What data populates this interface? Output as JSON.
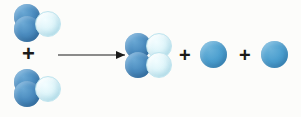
{
  "diagram": {
    "type": "chemical-reaction-equation",
    "background_color": "#fcfcfa",
    "canvas": {
      "width": 301,
      "height": 117
    },
    "atom_colors": {
      "dark_blue": "#4c8dc0",
      "light_blue": "#dff5fa",
      "medium_blue": "#4c9fcf"
    },
    "operators": {
      "plus_symbol": "+",
      "arrow_symbol": "→",
      "plus_color": "#1a1a1a",
      "arrow_color": "#1a1a1a"
    },
    "reactants": [
      {
        "id": "reactant-molecule-1",
        "label": "reactant molecule 1",
        "atoms": [
          {
            "id": "r1-atom-1",
            "color_key": "dark_blue",
            "x": 14,
            "y": 4,
            "d": 26
          },
          {
            "id": "r1-atom-2",
            "color_key": "dark_blue",
            "x": 14,
            "y": 16,
            "d": 26
          },
          {
            "id": "r1-atom-3",
            "color_key": "light_blue",
            "x": 35,
            "y": 11,
            "d": 26
          }
        ]
      },
      {
        "id": "reactant-molecule-2",
        "label": "reactant molecule 2",
        "atoms": [
          {
            "id": "r2-atom-1",
            "color_key": "dark_blue",
            "x": 14,
            "y": 69,
            "d": 26
          },
          {
            "id": "r2-atom-2",
            "color_key": "dark_blue",
            "x": 14,
            "y": 81,
            "d": 26
          },
          {
            "id": "r2-atom-3",
            "color_key": "light_blue",
            "x": 35,
            "y": 76,
            "d": 26
          }
        ]
      }
    ],
    "products": [
      {
        "id": "product-molecule-1",
        "label": "product molecule",
        "atoms": [
          {
            "id": "p1-atom-1",
            "color_key": "dark_blue",
            "x": 125,
            "y": 33,
            "d": 26
          },
          {
            "id": "p1-atom-2",
            "color_key": "dark_blue",
            "x": 125,
            "y": 52,
            "d": 26
          },
          {
            "id": "p1-atom-3",
            "color_key": "light_blue",
            "x": 146,
            "y": 33,
            "d": 26
          },
          {
            "id": "p1-atom-4",
            "color_key": "light_blue",
            "x": 146,
            "y": 52,
            "d": 26
          }
        ]
      },
      {
        "id": "product-atom-single-1",
        "label": "single product atom 1",
        "atoms": [
          {
            "id": "p2-atom-1",
            "color_key": "medium_blue",
            "x": 200,
            "y": 41,
            "d": 27
          }
        ]
      },
      {
        "id": "product-atom-single-2",
        "label": "single product atom 2",
        "atoms": [
          {
            "id": "p3-atom-1",
            "color_key": "medium_blue",
            "x": 261,
            "y": 41,
            "d": 27
          }
        ]
      }
    ],
    "plus_signs": [
      {
        "id": "plus-reactants",
        "text": "+",
        "x": 22,
        "y": 44,
        "size": 22
      },
      {
        "id": "plus-products-first",
        "text": "+",
        "x": 178,
        "y": 44,
        "size": 20
      },
      {
        "id": "plus-products-second",
        "text": "+",
        "x": 238,
        "y": 44,
        "size": 20
      }
    ],
    "arrow": {
      "id": "reaction-arrow",
      "text": "→",
      "x": 58,
      "y": 50,
      "length": 67
    }
  }
}
